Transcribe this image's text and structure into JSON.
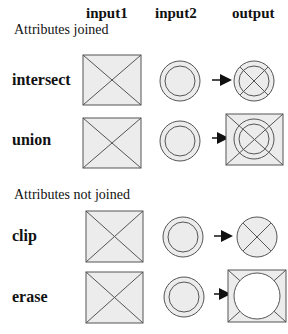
{
  "headers": {
    "input1": "input1",
    "input2": "input2",
    "output": "output"
  },
  "sections": [
    {
      "label": "Attributes joined",
      "operations": [
        "intersect",
        "union"
      ]
    },
    {
      "label": "Attributes not joined",
      "operations": [
        "clip",
        "erase"
      ]
    }
  ],
  "operations": {
    "intersect": "intersect",
    "union": "union",
    "clip": "clip",
    "erase": "erase"
  },
  "colors": {
    "fill": "#ececec",
    "stroke": "#555555",
    "arrow": "#111111",
    "background": "#ffffff"
  }
}
